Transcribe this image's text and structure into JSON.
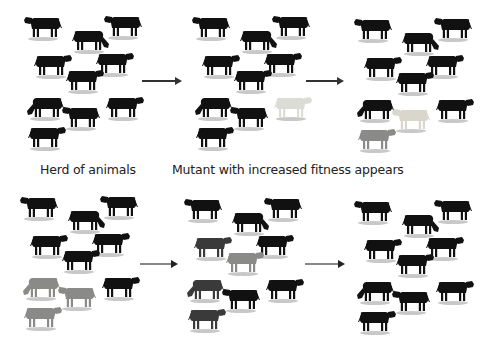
{
  "figure": {
    "captions": {
      "panel1": "Herd of animals",
      "panel2": "Mutant with increased fitness appears"
    },
    "colors": {
      "black_cow": "#111111",
      "mutant_white": "#dcdcd6",
      "mutant_light": "#d9d6cc",
      "mutant_grey": "#8a8a88",
      "mid_grey": "#555555",
      "dark_grey": "#3a3a3a",
      "shadow": "#9a9a9a",
      "arrow_dark": "#333333",
      "arrow_light": "#888888"
    },
    "cow_slots": [
      {
        "x": 2,
        "y": 5,
        "dir": "left",
        "pose": "stand"
      },
      {
        "x": 48,
        "y": 18,
        "dir": "right",
        "pose": "graze"
      },
      {
        "x": 82,
        "y": 4,
        "dir": "left",
        "pose": "stand"
      },
      {
        "x": 10,
        "y": 43,
        "dir": "right",
        "pose": "stand"
      },
      {
        "x": 72,
        "y": 41,
        "dir": "right",
        "pose": "stand"
      },
      {
        "x": 42,
        "y": 58,
        "dir": "right",
        "pose": "stand"
      },
      {
        "x": 4,
        "y": 85,
        "dir": "left",
        "pose": "graze"
      },
      {
        "x": 40,
        "y": 95,
        "dir": "left",
        "pose": "stand"
      },
      {
        "x": 82,
        "y": 85,
        "dir": "right",
        "pose": "stand"
      },
      {
        "x": 4,
        "y": 115,
        "dir": "right",
        "pose": "stand"
      }
    ],
    "panels": [
      {
        "id": "p1",
        "x": 22,
        "y": 8,
        "cow_colors": [
          "black",
          "black",
          "black",
          "black",
          "black",
          "black",
          "black",
          "black",
          "black",
          "black"
        ]
      },
      {
        "id": "p2",
        "x": 190,
        "y": 8,
        "cow_colors": [
          "black",
          "black",
          "black",
          "black",
          "black",
          "black",
          "black",
          "black",
          "white",
          "black"
        ]
      },
      {
        "id": "p3",
        "x": 352,
        "y": 10,
        "cow_colors": [
          "black",
          "black",
          "black",
          "black",
          "black",
          "black",
          "black",
          "light",
          "black",
          "grey"
        ]
      },
      {
        "id": "p4",
        "x": 18,
        "y": 188,
        "cow_colors": [
          "black",
          "black",
          "black",
          "black",
          "black",
          "black",
          "grey",
          "grey",
          "black",
          "grey"
        ]
      },
      {
        "id": "p5",
        "x": 182,
        "y": 190,
        "cow_colors": [
          "black",
          "black",
          "black",
          "dgrey",
          "black",
          "grey",
          "dgrey",
          "black",
          "black",
          "dgrey"
        ]
      },
      {
        "id": "p6",
        "x": 352,
        "y": 192,
        "cow_colors": [
          "black",
          "black",
          "black",
          "black",
          "black",
          "black",
          "black",
          "black",
          "black",
          "black"
        ]
      }
    ],
    "arrows": [
      {
        "x": 142,
        "y": 77,
        "w": 40,
        "tone": "dark"
      },
      {
        "x": 306,
        "y": 77,
        "w": 38,
        "tone": "dark"
      },
      {
        "x": 140,
        "y": 260,
        "w": 38,
        "tone": "light"
      },
      {
        "x": 305,
        "y": 260,
        "w": 40,
        "tone": "light"
      }
    ],
    "caption_positions": {
      "panel1": {
        "x": 40,
        "y": 162
      },
      "panel2": {
        "x": 172,
        "y": 162
      }
    }
  }
}
